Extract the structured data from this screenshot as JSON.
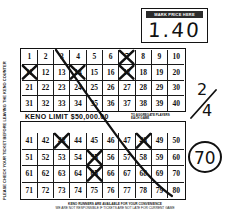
{
  "ticket": {
    "price_box": {
      "label": "MARK PRICE HERE",
      "value": "1.40"
    },
    "limit_bar": {
      "text": "KENO LIMIT  $50,000.00",
      "note_line1": "TO AGGREGATE PLAYERS",
      "note_line2": "EACH GAME"
    },
    "side_text": "PLEASE CHECK YOUR TICKET BEFORE LEAVING THE KENO COUNTER",
    "disclaimer": {
      "line1": "KENO RUNNERS ARE AVAILABLE FOR YOUR CONVENIENCE",
      "line2": "WE ARE NOT RESPONSIBLE IF TICKETS ARE NOT LATE FOR CURRENT GAME"
    },
    "grid": {
      "rows": [
        [
          1,
          2,
          3,
          4,
          5,
          6,
          7,
          8,
          9,
          10
        ],
        [
          11,
          12,
          13,
          14,
          15,
          16,
          17,
          18,
          19,
          20
        ],
        [
          21,
          22,
          23,
          24,
          25,
          26,
          27,
          28,
          29,
          30
        ],
        [
          31,
          32,
          33,
          34,
          35,
          36,
          37,
          38,
          39,
          40
        ],
        [
          41,
          42,
          43,
          44,
          45,
          46,
          47,
          48,
          49,
          50
        ],
        [
          51,
          52,
          53,
          54,
          55,
          56,
          57,
          58,
          59,
          60
        ],
        [
          61,
          62,
          63,
          64,
          65,
          66,
          67,
          68,
          69,
          70
        ],
        [
          71,
          72,
          73,
          74,
          75,
          76,
          77,
          78,
          79,
          80
        ]
      ],
      "marked_numbers": [
        7,
        11,
        14,
        17,
        43,
        48,
        55,
        65
      ]
    },
    "annotations": {
      "fraction_numerator": "2",
      "fraction_denominator": "4",
      "circled_number": "70"
    }
  }
}
